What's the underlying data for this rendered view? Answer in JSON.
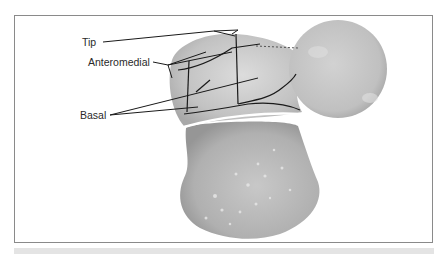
{
  "figure": {
    "labels": {
      "tip": "Tip",
      "anteromedial": "Anteromedial",
      "basal": "Basal"
    },
    "colors": {
      "frame_border": "#8a8a8a",
      "leader_line": "#1a1a1a",
      "tissue_light": "#d4d4d4",
      "tissue_mid": "#b8b8b8",
      "tissue_dark": "#9c9c9c"
    }
  }
}
